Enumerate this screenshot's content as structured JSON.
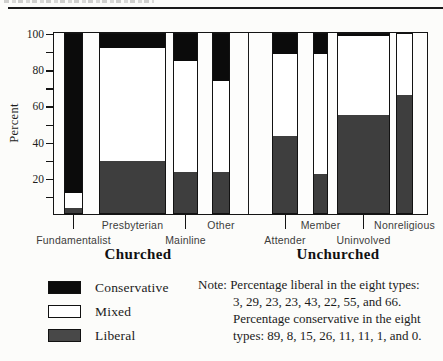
{
  "chart": {
    "ylabel": "Percent",
    "group_labels": [
      {
        "text": "Churched",
        "center_x": 138
      },
      {
        "text": "Unchurched",
        "center_x": 338
      }
    ]
  },
  "chart_data": {
    "type": "bar",
    "stacked": true,
    "ylabel": "Percent",
    "ylim": [
      0,
      100
    ],
    "y_ticks_labeled": [
      20,
      40,
      60,
      80,
      100
    ],
    "y_ticks_minor": [
      10,
      30,
      50,
      70,
      90
    ],
    "categories": [
      "Fundamentalist",
      "Presbyterian",
      "Mainline",
      "Other",
      "Attender",
      "Member",
      "Uninvolved",
      "Nonreligious"
    ],
    "category_groups": [
      "Churched",
      "Churched",
      "Churched",
      "Churched",
      "Unchurched",
      "Unchurched",
      "Unchurched",
      "Unchurched"
    ],
    "series": [
      {
        "name": "Conservative",
        "color": "#0b0b0b",
        "values": [
          89,
          8,
          15,
          26,
          11,
          11,
          1,
          0
        ]
      },
      {
        "name": "Mixed",
        "color": "#ffffff",
        "values": [
          8,
          63,
          62,
          51,
          46,
          67,
          44,
          34
        ]
      },
      {
        "name": "Liberal",
        "color": "#3e3e3e",
        "values": [
          3,
          29,
          23,
          23,
          43,
          22,
          55,
          66
        ]
      }
    ],
    "stack_order_bottom_to_top": [
      "Liberal",
      "Mixed",
      "Conservative"
    ],
    "bars_layout": [
      {
        "label": "Fundamentalist",
        "left": 64,
        "width": 19,
        "label_row": "lower"
      },
      {
        "label": "Presbyterian",
        "left": 99,
        "width": 67,
        "label_row": "upper"
      },
      {
        "label": "Mainline",
        "left": 173,
        "width": 25,
        "label_row": "lower"
      },
      {
        "label": "Other",
        "left": 212,
        "width": 18,
        "label_row": "upper"
      },
      {
        "label": "Attender",
        "left": 272,
        "width": 26,
        "label_row": "lower"
      },
      {
        "label": "Member",
        "left": 313,
        "width": 15,
        "label_row": "upper"
      },
      {
        "label": "Uninvolved",
        "left": 337,
        "width": 53,
        "label_row": "lower"
      },
      {
        "label": "Nonreligious",
        "left": 396,
        "width": 17,
        "label_row": "upper"
      }
    ],
    "group_divider_x": 248,
    "legend_position": "bottom-left",
    "grid": false
  },
  "legend": {
    "items": [
      {
        "label": "Conservative",
        "color": "#0b0b0b"
      },
      {
        "label": "Mixed",
        "color": "#ffffff"
      },
      {
        "label": "Liberal",
        "color": "#484848"
      }
    ]
  },
  "note": {
    "lines": [
      "Note: Percentage liberal in the eight types:",
      "3, 29, 23, 23, 43, 22, 55, and 66.",
      "Percentage conservative in the eight",
      "types: 89, 8, 15, 26, 11, 11, 1, and 0."
    ]
  }
}
